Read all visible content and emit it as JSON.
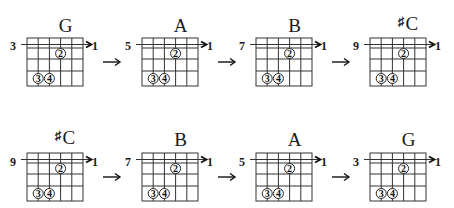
{
  "layout": {
    "rows": [
      {
        "diagrams": [
          {
            "chord": "G",
            "sharp": "",
            "fret": "3",
            "string": "1"
          },
          {
            "chord": "A",
            "sharp": "",
            "fret": "5",
            "string": "1"
          },
          {
            "chord": "B",
            "sharp": "",
            "fret": "7",
            "string": "1"
          },
          {
            "chord": "C",
            "sharp": "♯",
            "fret": "9",
            "string": "1"
          }
        ]
      },
      {
        "diagrams": [
          {
            "chord": "C",
            "sharp": "♯",
            "fret": "9",
            "string": "1"
          },
          {
            "chord": "B",
            "sharp": "",
            "fret": "7",
            "string": "1"
          },
          {
            "chord": "A",
            "sharp": "",
            "fret": "5",
            "string": "1"
          },
          {
            "chord": "G",
            "sharp": "",
            "fret": "3",
            "string": "1"
          }
        ]
      }
    ]
  },
  "fingering": {
    "strings": 6,
    "frets": 4,
    "barre_string_label": "1",
    "dots": [
      {
        "finger": "2",
        "string_index": 3,
        "fret_row": 2
      },
      {
        "finger": "3",
        "string_index": 1,
        "fret_row": 4
      },
      {
        "finger": "4",
        "string_index": 2,
        "fret_row": 4
      }
    ]
  },
  "colors": {
    "ink": "#1a1a1a",
    "grid": "#333333",
    "background": "#ffffff"
  },
  "arrow_glyph": "→"
}
